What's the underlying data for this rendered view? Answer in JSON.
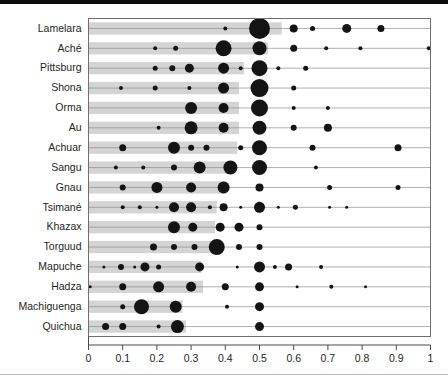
{
  "chart_data": {
    "type": "scatter",
    "title": "",
    "subtitle": "",
    "xlabel": "",
    "ylabel": "",
    "xlim": [
      0,
      1
    ],
    "ylim_categories_top_to_bottom": true,
    "grid": false,
    "legend": "none",
    "xticks": [
      "0",
      "0.1",
      "0.2",
      "0.3",
      "0.4",
      "0.5",
      "0.6",
      "0.7",
      "0.8",
      "0.9",
      "1"
    ],
    "xtick_values": [
      0,
      0.1,
      0.2,
      0.3,
      0.4,
      0.5,
      0.6,
      0.7,
      0.8,
      0.9,
      1
    ],
    "categories": [
      "Lamelara",
      "Aché",
      "Pittsburg",
      "Shona",
      "Orma",
      "Au",
      "Achuar",
      "Sangu",
      "Gnau",
      "Tsimané",
      "Khazax",
      "Torguud",
      "Mapuche",
      "Hadza",
      "Machiguenga",
      "Quichua"
    ],
    "marker_color": "#141414",
    "row_band_color": "#d4d4d4",
    "row_line_color": "#8c8c8c",
    "series": [
      {
        "name": "Lamelara",
        "bar_extent": [
          0,
          0.565
        ],
        "points": [
          {
            "x": 0.4,
            "size": 4
          },
          {
            "x": 0.5,
            "size": 21
          },
          {
            "x": 0.6,
            "size": 8
          },
          {
            "x": 0.655,
            "size": 5
          },
          {
            "x": 0.755,
            "size": 9
          },
          {
            "x": 0.855,
            "size": 7
          }
        ]
      },
      {
        "name": "Aché",
        "bar_extent": [
          0,
          0.525
        ],
        "points": [
          {
            "x": 0.195,
            "size": 4
          },
          {
            "x": 0.255,
            "size": 5
          },
          {
            "x": 0.395,
            "size": 16
          },
          {
            "x": 0.5,
            "size": 14
          },
          {
            "x": 0.6,
            "size": 7
          },
          {
            "x": 0.695,
            "size": 4
          },
          {
            "x": 0.795,
            "size": 4
          },
          {
            "x": 0.995,
            "size": 4
          }
        ]
      },
      {
        "name": "Pittsburg",
        "bar_extent": [
          0,
          0.455
        ],
        "points": [
          {
            "x": 0.195,
            "size": 5
          },
          {
            "x": 0.245,
            "size": 6
          },
          {
            "x": 0.295,
            "size": 9
          },
          {
            "x": 0.395,
            "size": 11
          },
          {
            "x": 0.445,
            "size": 4
          },
          {
            "x": 0.5,
            "size": 16
          },
          {
            "x": 0.555,
            "size": 4
          },
          {
            "x": 0.635,
            "size": 5
          }
        ]
      },
      {
        "name": "Shona",
        "bar_extent": [
          0,
          0.44
        ],
        "points": [
          {
            "x": 0.095,
            "size": 4
          },
          {
            "x": 0.195,
            "size": 5
          },
          {
            "x": 0.295,
            "size": 4
          },
          {
            "x": 0.395,
            "size": 11
          },
          {
            "x": 0.5,
            "size": 18
          },
          {
            "x": 0.6,
            "size": 5
          }
        ]
      },
      {
        "name": "Orma",
        "bar_extent": [
          0,
          0.44
        ],
        "points": [
          {
            "x": 0.3,
            "size": 12
          },
          {
            "x": 0.395,
            "size": 10
          },
          {
            "x": 0.5,
            "size": 17
          },
          {
            "x": 0.6,
            "size": 4
          },
          {
            "x": 0.7,
            "size": 4
          }
        ]
      },
      {
        "name": "Au",
        "bar_extent": [
          0,
          0.44
        ],
        "points": [
          {
            "x": 0.205,
            "size": 4
          },
          {
            "x": 0.3,
            "size": 13
          },
          {
            "x": 0.395,
            "size": 10
          },
          {
            "x": 0.5,
            "size": 14
          },
          {
            "x": 0.6,
            "size": 6
          },
          {
            "x": 0.7,
            "size": 8
          }
        ]
      },
      {
        "name": "Achuar",
        "bar_extent": [
          0,
          0.435
        ],
        "points": [
          {
            "x": 0.1,
            "size": 7
          },
          {
            "x": 0.25,
            "size": 12
          },
          {
            "x": 0.3,
            "size": 6
          },
          {
            "x": 0.345,
            "size": 6
          },
          {
            "x": 0.445,
            "size": 5
          },
          {
            "x": 0.5,
            "size": 15
          },
          {
            "x": 0.655,
            "size": 6
          },
          {
            "x": 0.905,
            "size": 7
          }
        ]
      },
      {
        "name": "Sangu",
        "bar_extent": [
          0,
          0.425
        ],
        "points": [
          {
            "x": 0.08,
            "size": 4
          },
          {
            "x": 0.16,
            "size": 4
          },
          {
            "x": 0.25,
            "size": 6
          },
          {
            "x": 0.325,
            "size": 12
          },
          {
            "x": 0.415,
            "size": 14
          },
          {
            "x": 0.5,
            "size": 15
          },
          {
            "x": 0.665,
            "size": 4
          }
        ]
      },
      {
        "name": "Gnau",
        "bar_extent": [
          0,
          0.405
        ],
        "points": [
          {
            "x": 0.1,
            "size": 6
          },
          {
            "x": 0.2,
            "size": 11
          },
          {
            "x": 0.3,
            "size": 10
          },
          {
            "x": 0.395,
            "size": 12
          },
          {
            "x": 0.5,
            "size": 8
          },
          {
            "x": 0.705,
            "size": 5
          },
          {
            "x": 0.905,
            "size": 5
          }
        ]
      },
      {
        "name": "Tsimané",
        "bar_extent": [
          0,
          0.375
        ],
        "points": [
          {
            "x": 0.1,
            "size": 4
          },
          {
            "x": 0.15,
            "size": 4
          },
          {
            "x": 0.2,
            "size": 3
          },
          {
            "x": 0.25,
            "size": 10
          },
          {
            "x": 0.3,
            "size": 10
          },
          {
            "x": 0.355,
            "size": 4
          },
          {
            "x": 0.395,
            "size": 8
          },
          {
            "x": 0.445,
            "size": 3
          },
          {
            "x": 0.5,
            "size": 11
          },
          {
            "x": 0.555,
            "size": 3
          },
          {
            "x": 0.605,
            "size": 5
          },
          {
            "x": 0.705,
            "size": 3
          },
          {
            "x": 0.755,
            "size": 3
          }
        ]
      },
      {
        "name": "Khazax",
        "bar_extent": [
          0,
          0.37
        ],
        "points": [
          {
            "x": 0.25,
            "size": 12
          },
          {
            "x": 0.305,
            "size": 9
          },
          {
            "x": 0.385,
            "size": 9
          },
          {
            "x": 0.44,
            "size": 9
          },
          {
            "x": 0.5,
            "size": 6
          }
        ]
      },
      {
        "name": "Torguud",
        "bar_extent": [
          0,
          0.365
        ],
        "points": [
          {
            "x": 0.19,
            "size": 7
          },
          {
            "x": 0.25,
            "size": 6
          },
          {
            "x": 0.31,
            "size": 6
          },
          {
            "x": 0.375,
            "size": 16
          },
          {
            "x": 0.44,
            "size": 6
          },
          {
            "x": 0.5,
            "size": 6
          }
        ]
      },
      {
        "name": "Mapuche",
        "bar_extent": [
          0,
          0.33
        ],
        "points": [
          {
            "x": 0.045,
            "size": 3
          },
          {
            "x": 0.095,
            "size": 6
          },
          {
            "x": 0.135,
            "size": 3
          },
          {
            "x": 0.165,
            "size": 9
          },
          {
            "x": 0.205,
            "size": 5
          },
          {
            "x": 0.325,
            "size": 9
          },
          {
            "x": 0.435,
            "size": 3
          },
          {
            "x": 0.5,
            "size": 11
          },
          {
            "x": 0.545,
            "size": 4
          },
          {
            "x": 0.585,
            "size": 7
          },
          {
            "x": 0.68,
            "size": 4
          }
        ]
      },
      {
        "name": "Hadza",
        "bar_extent": [
          0,
          0.335
        ],
        "points": [
          {
            "x": 0.005,
            "size": 3
          },
          {
            "x": 0.1,
            "size": 7
          },
          {
            "x": 0.205,
            "size": 11
          },
          {
            "x": 0.3,
            "size": 10
          },
          {
            "x": 0.4,
            "size": 7
          },
          {
            "x": 0.5,
            "size": 9
          },
          {
            "x": 0.61,
            "size": 3
          },
          {
            "x": 0.71,
            "size": 4
          },
          {
            "x": 0.81,
            "size": 3
          }
        ]
      },
      {
        "name": "Machiguenga",
        "bar_extent": [
          0,
          0.275
        ],
        "points": [
          {
            "x": 0.1,
            "size": 5
          },
          {
            "x": 0.155,
            "size": 15
          },
          {
            "x": 0.255,
            "size": 12
          },
          {
            "x": 0.405,
            "size": 4
          },
          {
            "x": 0.5,
            "size": 9
          }
        ]
      },
      {
        "name": "Quichua",
        "bar_extent": [
          0,
          0.285
        ],
        "points": [
          {
            "x": 0.05,
            "size": 7
          },
          {
            "x": 0.1,
            "size": 7
          },
          {
            "x": 0.205,
            "size": 4
          },
          {
            "x": 0.26,
            "size": 13
          },
          {
            "x": 0.5,
            "size": 9
          }
        ]
      }
    ]
  }
}
